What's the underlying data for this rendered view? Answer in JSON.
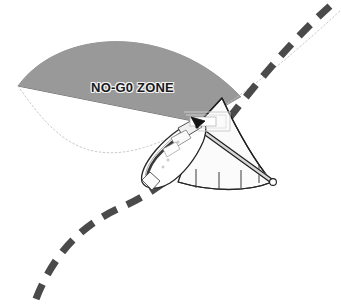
{
  "diagram": {
    "title": "",
    "canvas": {
      "width": 341,
      "height": 305,
      "background": "#ffffff"
    },
    "labels": {
      "no_go_zone": "NO-G0 ZONE"
    },
    "colors": {
      "no_go_fill": "#999999",
      "no_go_stroke": "#5a5a5a",
      "dashed_boundary": "#4a4a4a",
      "thin_dotted_line": "#b9b9b9",
      "swath_fill": "#fbfbfb",
      "swath_stroke": "#1f1f1f",
      "vessel_fill": "#ffffff",
      "vessel_stroke": "#262626",
      "hull_shadow": "#3a3a3a",
      "marker_dark": "#141414",
      "cabin_fill": "#f0f0f0",
      "outline_box": "#c9c9c9",
      "page_background": "#ffffff"
    },
    "elements": {
      "no_go_wedge": "no-go-zone-wedge",
      "swath_cone": "sonar-swath-cone",
      "vessel": "survey-vessel",
      "boom": "transducer-boom",
      "heading_marker": "heading-arrow-marker",
      "boundary_dashed": "survey-boundary-dashed-line",
      "trackline_dotted": "planned-trackline-dotted"
    },
    "swath": {
      "range_tick_count": 4,
      "range_ticks": [
        "1",
        "2",
        "3",
        "4"
      ]
    }
  }
}
